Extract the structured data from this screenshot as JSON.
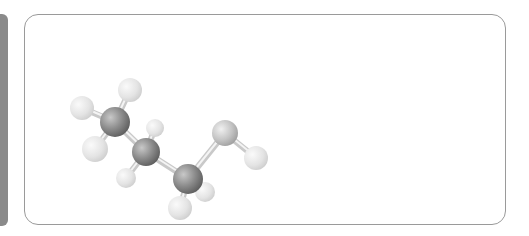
{
  "figure": {
    "colors": {
      "sidebar": "#8a8a8a",
      "panel_border": "#9a9a9a",
      "carbon": "#8c8c8c",
      "oxygen": "#c4c4c4",
      "hydrogen": "#e4e4e4",
      "bond": "#d8d8d8"
    },
    "atoms": [
      {
        "id": "C1",
        "element": "C",
        "x": 115,
        "y": 122,
        "r": 15
      },
      {
        "id": "C2",
        "element": "C",
        "x": 146,
        "y": 152,
        "r": 14
      },
      {
        "id": "C3",
        "element": "C",
        "x": 188,
        "y": 179,
        "r": 15
      },
      {
        "id": "O",
        "element": "O",
        "x": 225,
        "y": 133,
        "r": 13
      },
      {
        "id": "H1",
        "element": "H",
        "x": 82,
        "y": 108,
        "r": 12
      },
      {
        "id": "H2",
        "element": "H",
        "x": 130,
        "y": 90,
        "r": 12
      },
      {
        "id": "H3",
        "element": "H",
        "x": 95,
        "y": 149,
        "r": 13
      },
      {
        "id": "H4",
        "element": "H",
        "x": 155,
        "y": 128,
        "r": 9
      },
      {
        "id": "H5",
        "element": "H",
        "x": 126,
        "y": 178,
        "r": 10
      },
      {
        "id": "H6",
        "element": "H",
        "x": 180,
        "y": 208,
        "r": 12
      },
      {
        "id": "H7",
        "element": "H",
        "x": 205,
        "y": 192,
        "r": 10
      },
      {
        "id": "H8",
        "element": "H",
        "x": 256,
        "y": 158,
        "r": 12
      }
    ],
    "bonds": [
      [
        "C1",
        "H1"
      ],
      [
        "C1",
        "H2"
      ],
      [
        "C1",
        "H3"
      ],
      [
        "C1",
        "C2"
      ],
      [
        "C2",
        "H4"
      ],
      [
        "C2",
        "H5"
      ],
      [
        "C2",
        "C3"
      ],
      [
        "C3",
        "H6"
      ],
      [
        "C3",
        "H7"
      ],
      [
        "C3",
        "O"
      ],
      [
        "O",
        "H8"
      ]
    ]
  }
}
